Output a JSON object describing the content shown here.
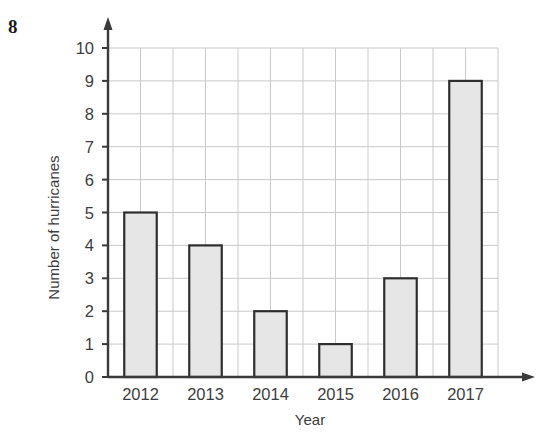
{
  "question_number": "8",
  "chart_data": {
    "type": "bar",
    "title": "",
    "xlabel": "Year",
    "ylabel": "Number of hurricanes",
    "categories": [
      "2012",
      "2013",
      "2014",
      "2015",
      "2016",
      "2017"
    ],
    "values": [
      5,
      4,
      2,
      1,
      3,
      9
    ],
    "ylim": [
      0,
      10
    ],
    "y_ticks": [
      "0",
      "1",
      "2",
      "3",
      "4",
      "5",
      "6",
      "7",
      "8",
      "9",
      "10"
    ],
    "grid": true,
    "legend": "none",
    "bar_fill": "#e6e6e6",
    "bar_stroke": "#2e2e2e",
    "axis_color": "#3a3a3a",
    "grid_color": "#c9c9c9"
  }
}
